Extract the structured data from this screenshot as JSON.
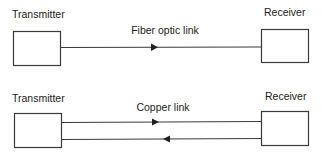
{
  "diagrams": [
    {
      "name": "fiber",
      "transmitter_label": "Transmitter",
      "receiver_label": "Receiver",
      "link_label": "Fiber optic link",
      "lines": [
        {
          "direction": "right"
        }
      ]
    },
    {
      "name": "copper",
      "transmitter_label": "Transmitter",
      "receiver_label": "Receiver",
      "link_label": "Copper link",
      "lines": [
        {
          "direction": "right"
        },
        {
          "direction": "left"
        }
      ]
    }
  ],
  "colors": {
    "stroke": "#3a3a3a",
    "text": "#222222",
    "background": "#ffffff"
  }
}
